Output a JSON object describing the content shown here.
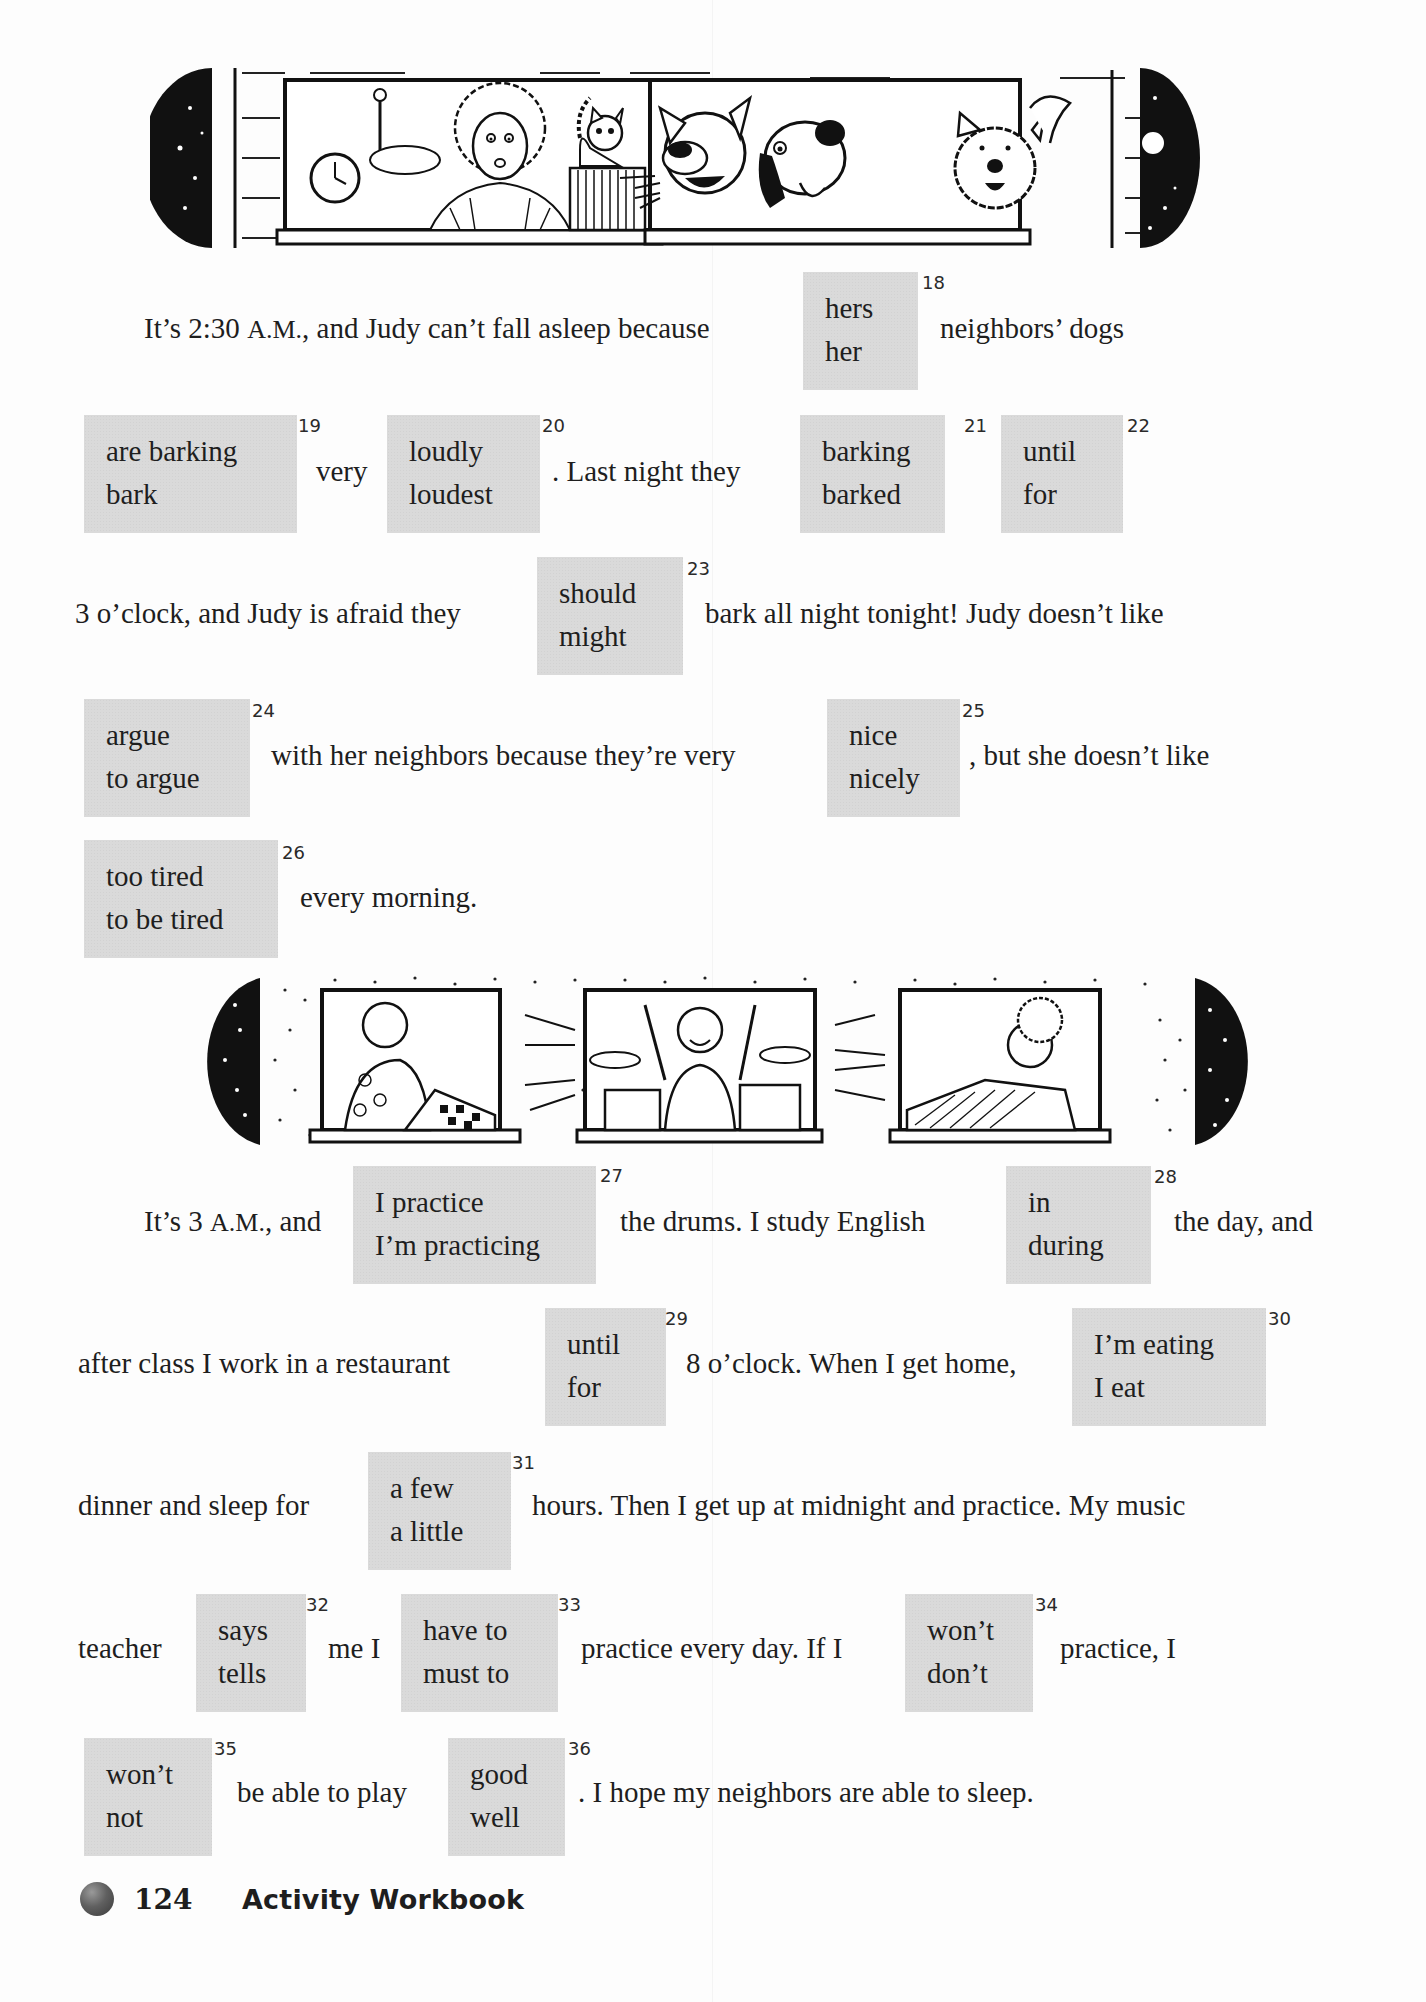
{
  "passage1": {
    "line1": {
      "before": "It’s 2:30 ",
      "am": "A.M.",
      "after": ", and Judy can’t fall asleep because",
      "end": "neighbors’ dogs"
    },
    "line2": {
      "very": "very",
      "mid": ". Last night they"
    },
    "line3": {
      "before": "3 o’clock, and Judy is afraid they",
      "after": "bark all night tonight!  Judy doesn’t like"
    },
    "line4": {
      "mid": "with her neighbors because they’re very",
      "after": ", but she doesn’t like"
    },
    "line5": {
      "after": "every morning."
    }
  },
  "passage2": {
    "line6": {
      "before": "It’s 3 ",
      "am": "A.M.",
      "after": ", and",
      "mid": "the drums.  I study English",
      "end": "the day, and"
    },
    "line7": {
      "before": "after class I work in a restaurant",
      "mid": "8 o’clock.  When I get home,"
    },
    "line8": {
      "before": "dinner and sleep for",
      "after": "hours.  Then I get up at midnight and practice.  My music"
    },
    "line9": {
      "before": "teacher",
      "mid1": "me I",
      "mid2": "practice every day.  If I",
      "after": "practice, I"
    },
    "line10": {
      "mid": "be able to play",
      "after": ".  I hope my neighbors are able to sleep."
    }
  },
  "choices": {
    "q18": {
      "number": "18",
      "options": [
        "hers",
        "her"
      ]
    },
    "q19": {
      "number": "19",
      "options": [
        "are barking",
        "bark"
      ]
    },
    "q20": {
      "number": "20",
      "options": [
        "loudly",
        "loudest"
      ]
    },
    "q21": {
      "number": "21",
      "options": [
        "barking",
        "barked"
      ]
    },
    "q22": {
      "number": "22",
      "options": [
        "until",
        "for"
      ]
    },
    "q23": {
      "number": "23",
      "options": [
        "should",
        "might"
      ]
    },
    "q24": {
      "number": "24",
      "options": [
        "argue",
        "to argue"
      ]
    },
    "q25": {
      "number": "25",
      "options": [
        "nice",
        "nicely"
      ]
    },
    "q26": {
      "number": "26",
      "options": [
        "too tired",
        "to be tired"
      ]
    },
    "q27": {
      "number": "27",
      "options": [
        "I practice",
        "I’m practicing"
      ]
    },
    "q28": {
      "number": "28",
      "options": [
        "in",
        "during"
      ]
    },
    "q29": {
      "number": "29",
      "options": [
        "until",
        "for"
      ]
    },
    "q30": {
      "number": "30",
      "options": [
        "I’m eating",
        "I eat"
      ]
    },
    "q31": {
      "number": "31",
      "options": [
        "a few",
        "a little"
      ]
    },
    "q32": {
      "number": "32",
      "options": [
        "says",
        "tells"
      ]
    },
    "q33": {
      "number": "33",
      "options": [
        "have to",
        "must to"
      ]
    },
    "q34": {
      "number": "34",
      "options": [
        "won’t",
        "don’t"
      ]
    },
    "q35": {
      "number": "35",
      "options": [
        "won’t",
        "not"
      ]
    },
    "q36": {
      "number": "36",
      "options": [
        "good",
        "well"
      ]
    }
  },
  "illustrations": {
    "top": {
      "description": "Night scene: Judy awake in bed by an alarm clock with her cat; neighbors’ three dogs barking in the next window"
    },
    "bottom": {
      "description": "Night scene: a woman startled in bed, a boy playing the drums, and another woman awakened in bed"
    }
  },
  "footer": {
    "page_number": "124",
    "title": "Activity Workbook"
  }
}
